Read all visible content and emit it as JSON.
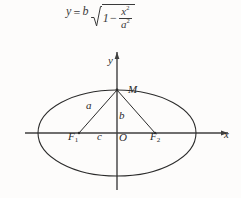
{
  "figure": {
    "kind": "ellipse-geometry-diagram",
    "background_color": "#fdfcfb",
    "ink_color": "#2b2b2b"
  },
  "formula": {
    "lhs": "y",
    "equals": "=",
    "coefficient": "b",
    "radical_symbol": "sqrt-icon",
    "one": "1",
    "minus": "−",
    "numerator": "x",
    "numerator_exponent": "2",
    "denominator": "a",
    "denominator_exponent": "2",
    "plain_text": "y = b√(1 − x²/a²)"
  },
  "axes": {
    "x_label": "x",
    "y_label": "y",
    "origin_label": "O"
  },
  "points": {
    "vertex_top": "M",
    "focus_left": "F",
    "focus_left_sub": "1",
    "focus_right": "F",
    "focus_right_sub": "2"
  },
  "segments": {
    "semi_major": "a",
    "semi_minor": "b",
    "focal_distance": "c"
  },
  "geometry": {
    "center_x": 117,
    "center_y": 133,
    "semi_axis_x": 79,
    "semi_axis_y": 43,
    "focus_left_x": 79,
    "focus_right_x": 155,
    "x_axis_start": 25,
    "x_axis_end": 228,
    "y_axis_top": 52,
    "y_axis_bottom": 190
  }
}
